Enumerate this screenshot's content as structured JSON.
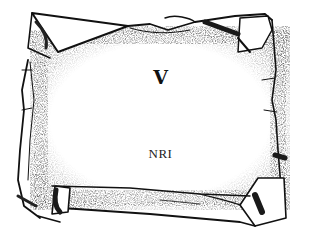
{
  "scroll": {
    "title": "V",
    "subtitle": "NRI"
  },
  "colors": {
    "ink": "#111111",
    "paper": "#ffffff",
    "shade": "#555555"
  }
}
